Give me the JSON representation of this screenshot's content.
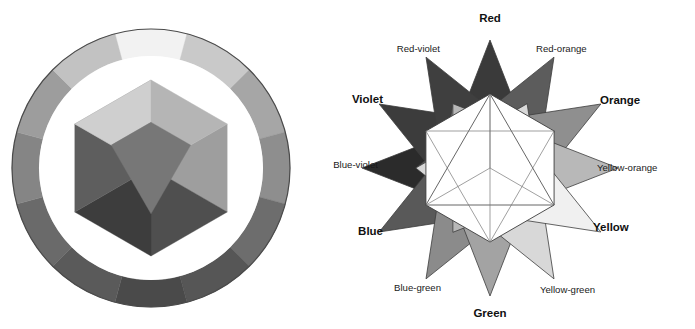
{
  "figure": {
    "background": "#ffffff",
    "panels": [
      {
        "id": "color-wheel",
        "caption": ""
      },
      {
        "id": "color-star",
        "caption": ""
      }
    ]
  },
  "color_wheel": {
    "name": "twelve-segment-color-wheel",
    "center": {
      "x": 151,
      "y": 168
    },
    "outer_radius": 139,
    "ring_inner_radius": 112,
    "gap_radius": 98,
    "hexagon_radius": 88,
    "rim_stroke": "#4a4a4a",
    "gap_fill": "#ffffff",
    "segments": [
      {
        "label": "Yellow",
        "angle_deg": 0,
        "fill": "#f2f2f2"
      },
      {
        "label": "Yellow-orange",
        "angle_deg": 30,
        "fill": "#c9c9c9"
      },
      {
        "label": "Orange",
        "angle_deg": 60,
        "fill": "#a6a6a6"
      },
      {
        "label": "Red-orange",
        "angle_deg": 90,
        "fill": "#8e8e8e"
      },
      {
        "label": "Red",
        "angle_deg": 120,
        "fill": "#6d6d6d"
      },
      {
        "label": "Red-violet",
        "angle_deg": 150,
        "fill": "#565656"
      },
      {
        "label": "Violet",
        "angle_deg": 180,
        "fill": "#4a4a4a"
      },
      {
        "label": "Blue-violet",
        "angle_deg": 210,
        "fill": "#5a5a5a"
      },
      {
        "label": "Blue",
        "angle_deg": 240,
        "fill": "#6a6a6a"
      },
      {
        "label": "Blue-green",
        "angle_deg": 270,
        "fill": "#858585"
      },
      {
        "label": "Green",
        "angle_deg": 300,
        "fill": "#9d9d9d"
      },
      {
        "label": "Yellow-green",
        "angle_deg": 330,
        "fill": "#c2c2c2"
      }
    ],
    "inner_facets": [
      {
        "label": "Yellow",
        "fill": "#ededed"
      },
      {
        "label": "Orange",
        "fill": "#9e9e9e"
      },
      {
        "label": "Red",
        "fill": "#4f4f4f"
      },
      {
        "label": "Violet",
        "fill": "#3d3d3d"
      },
      {
        "label": "Blue",
        "fill": "#5e5e5e"
      },
      {
        "label": "Green",
        "fill": "#8a8a8a"
      }
    ],
    "inner_core": [
      {
        "label": "core-upper-left",
        "fill": "#cfcfcf"
      },
      {
        "label": "core-upper-right",
        "fill": "#b5b5b5"
      },
      {
        "label": "core-lower",
        "fill": "#777777"
      }
    ]
  },
  "color_star": {
    "name": "twelve-point-color-star",
    "center": {
      "x": 190,
      "y": 168
    },
    "point_radius": 128,
    "hex_radius": 74,
    "stroke": "#3c3c3c",
    "inner_fill": "#ffffff",
    "primary_triangle_stroke": "#555555",
    "secondary_triangle_stroke": "#777777",
    "points": [
      {
        "label": "Red",
        "emphasis": "bold",
        "angle_deg": 90,
        "fill": "#3a3a3a",
        "label_x": 190,
        "label_y": 22,
        "anchor": "middle"
      },
      {
        "label": "Red-orange",
        "emphasis": "plain",
        "angle_deg": 60,
        "fill": "#5c5c5c",
        "label_x": 236,
        "label_y": 52,
        "anchor": "start"
      },
      {
        "label": "Orange",
        "emphasis": "bold",
        "angle_deg": 30,
        "fill": "#8f8f8f",
        "label_x": 300,
        "label_y": 104,
        "anchor": "start"
      },
      {
        "label": "Yellow-orange",
        "emphasis": "plain",
        "angle_deg": 0,
        "fill": "#b8b8b8",
        "label_x": 297,
        "label_y": 171,
        "anchor": "start"
      },
      {
        "label": "Yellow",
        "emphasis": "bold",
        "angle_deg": -30,
        "fill": "#f0f0f0",
        "label_x": 293,
        "label_y": 231,
        "anchor": "start"
      },
      {
        "label": "Yellow-green",
        "emphasis": "plain",
        "angle_deg": -60,
        "fill": "#d8d8d8",
        "label_x": 240,
        "label_y": 293,
        "anchor": "start"
      },
      {
        "label": "Green",
        "emphasis": "bold",
        "angle_deg": -90,
        "fill": "#a3a3a3",
        "label_x": 190,
        "label_y": 317,
        "anchor": "middle"
      },
      {
        "label": "Blue-green",
        "emphasis": "plain",
        "angle_deg": -120,
        "fill": "#8b8b8b",
        "label_x": 141,
        "label_y": 291,
        "anchor": "end"
      },
      {
        "label": "Blue",
        "emphasis": "bold",
        "angle_deg": -150,
        "fill": "#595959",
        "label_x": 83,
        "label_y": 235,
        "anchor": "end"
      },
      {
        "label": "Blue-violet",
        "emphasis": "plain",
        "angle_deg": 180,
        "fill": "#2b2b2b",
        "label_x": 78,
        "label_y": 168,
        "anchor": "end"
      },
      {
        "label": "Violet",
        "emphasis": "bold",
        "angle_deg": 150,
        "fill": "#3c3c3c",
        "label_x": 83,
        "label_y": 103,
        "anchor": "end"
      },
      {
        "label": "Red-violet",
        "emphasis": "plain",
        "angle_deg": 120,
        "fill": "#3f3f3f",
        "label_x": 140,
        "label_y": 52,
        "anchor": "end"
      }
    ]
  }
}
